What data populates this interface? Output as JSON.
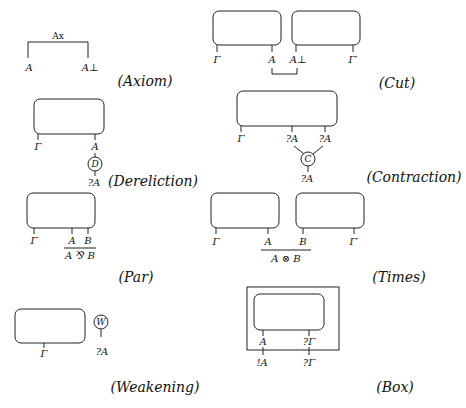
{
  "rules": {
    "axiom": {
      "caption": "(Axiom)",
      "link_label": "Ax",
      "left_label": "A",
      "right_label": "A⊥"
    },
    "cut": {
      "caption": "(Cut)",
      "labels": [
        "Γ",
        "A",
        "A⊥",
        "Γ′"
      ]
    },
    "dereliction": {
      "caption": "(Dereliction)",
      "labels": [
        "Γ",
        "A"
      ],
      "node": "D",
      "output": "?A"
    },
    "contraction": {
      "caption": "(Contraction)",
      "labels": [
        "Γ",
        "?A",
        "?A"
      ],
      "node": "C",
      "output": "?A"
    },
    "par": {
      "caption": "(Par)",
      "labels": [
        "Γ",
        "A",
        "B"
      ],
      "conclusion": "A ⅋ B"
    },
    "times": {
      "caption": "(Times)",
      "labels": [
        "Γ",
        "A",
        "B",
        "Γ′"
      ],
      "conclusion": "A ⊗ B"
    },
    "weakening": {
      "caption": "(Weakening)",
      "labels": [
        "Γ"
      ],
      "node": "W",
      "output": "?A"
    },
    "box": {
      "caption": "(Box)",
      "inner_labels": [
        "A",
        "?Γ"
      ],
      "outer_labels": [
        "!A",
        "?Γ"
      ]
    }
  }
}
